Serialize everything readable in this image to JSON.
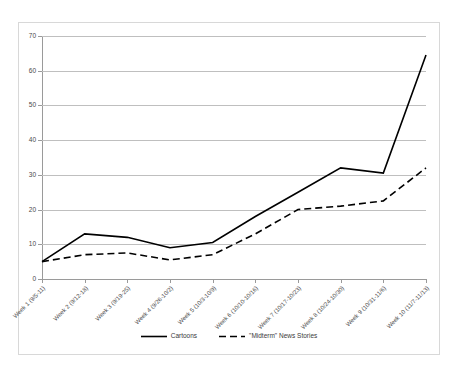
{
  "chart_data": {
    "type": "line",
    "title": "",
    "xlabel": "",
    "ylabel": "",
    "ylim": [
      0,
      70
    ],
    "yticks": [
      0,
      10,
      20,
      30,
      40,
      50,
      60,
      70
    ],
    "grid": true,
    "legend_position": "bottom-center",
    "categories": [
      "Week 1 (9/5-11)",
      "Week 2 (9/12-18)",
      "Week 3 (9/19-25)",
      "Week 4 (9/26-10/2)",
      "Week 5 (10/3-10/9)",
      "Week 6 (10/10-10/16)",
      "Week 7 (10/17-10/23)",
      "Week 8 (10/24-10/30)",
      "Week 9 (10/31-11/6)",
      "Week 10 (11/7-11/13)"
    ],
    "series": [
      {
        "name": "Cartoons",
        "style": "solid",
        "color": "#000000",
        "values": [
          5,
          13,
          12,
          9,
          10.5,
          18,
          25,
          32,
          30.5,
          64.5
        ]
      },
      {
        "name": "\"Midterm\" News Stories",
        "style": "dashed",
        "color": "#000000",
        "values": [
          5,
          7,
          7.5,
          5.5,
          7,
          13,
          20,
          21,
          22.5,
          32
        ]
      }
    ]
  },
  "legend": {
    "entries": [
      {
        "label": "Cartoons",
        "style": "solid"
      },
      {
        "label": "\"Midterm\" News Stories",
        "style": "dashed"
      }
    ]
  }
}
